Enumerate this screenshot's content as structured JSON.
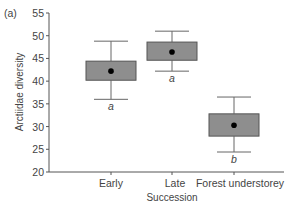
{
  "panel_label": "(a)",
  "colors": {
    "box_fill": "#8e8e8e",
    "box_stroke": "#555555",
    "whisker": "#666666",
    "mean_dot": "#000000",
    "axis": "#555555"
  },
  "chart_data": {
    "type": "box",
    "title": "",
    "xlabel": "Succession",
    "ylabel": "Arctiidae diversity",
    "ylim": [
      20,
      55
    ],
    "yticks": [
      20,
      25,
      30,
      35,
      40,
      45,
      50,
      55
    ],
    "grid": false,
    "categories": [
      "Early",
      "Late",
      "Forest understorey"
    ],
    "series": [
      {
        "name": "Early",
        "whisker_low": 36.0,
        "q1": 40.2,
        "mean": 42.2,
        "q3": 44.4,
        "whisker_high": 48.8,
        "group_letter": "a"
      },
      {
        "name": "Late",
        "whisker_low": 42.2,
        "q1": 44.6,
        "mean": 46.4,
        "q3": 48.6,
        "whisker_high": 51.0,
        "group_letter": "a"
      },
      {
        "name": "Forest understorey",
        "whisker_low": 24.4,
        "q1": 27.9,
        "mean": 30.3,
        "q3": 32.8,
        "whisker_high": 36.5,
        "group_letter": "b"
      }
    ]
  }
}
